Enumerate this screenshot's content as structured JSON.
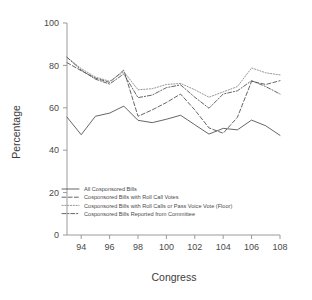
{
  "chart_data": {
    "type": "line",
    "title": "",
    "xlabel": "Congress",
    "ylabel": "Percentage",
    "xlim": [
      93,
      108
    ],
    "ylim": [
      0,
      100
    ],
    "xticks": [
      94,
      96,
      98,
      100,
      102,
      104,
      106,
      108
    ],
    "xtick_labels": [
      "94",
      "96",
      "98",
      "100",
      "102",
      "104",
      "106",
      "108"
    ],
    "yticks": [
      0,
      20,
      40,
      60,
      80,
      100
    ],
    "ytick_labels": [
      "0",
      "20",
      "40",
      "60",
      "80",
      "100"
    ],
    "grid": false,
    "legend_position": "bottom-left",
    "x": [
      93,
      94,
      95,
      96,
      97,
      98,
      99,
      100,
      101,
      102,
      103,
      104,
      105,
      106,
      107,
      108
    ],
    "series": [
      {
        "name": "All Cosponsored Bills",
        "style": "solid",
        "color": "#555555",
        "values": [
          55.6,
          47.3,
          56.0,
          57.5,
          60.8,
          54.1,
          53.0,
          54.6,
          56.5,
          52.0,
          47.6,
          50.3,
          49.6,
          54.2,
          51.5,
          47.0
        ]
      },
      {
        "name": "Cosponsored Bills with Roll Call Votes",
        "style": "dashed",
        "color": "#555555",
        "values": [
          81.3,
          77.5,
          74.0,
          72.0,
          77.8,
          56.0,
          59.0,
          62.5,
          66.5,
          59.0,
          50.5,
          48.0,
          55.5,
          72.5,
          71.0,
          72.8
        ]
      },
      {
        "name": "Cosponsored Bills with Roll Calls or Pass Voice Vote (Floor)",
        "style": "dotted",
        "color": "#8a8a8a",
        "values": [
          83.8,
          78.5,
          74.5,
          72.5,
          77.0,
          68.5,
          69.0,
          71.0,
          71.5,
          68.5,
          65.0,
          67.5,
          70.0,
          78.8,
          76.5,
          75.5
        ]
      },
      {
        "name": "Cosponsored Bills Reported from Committee",
        "style": "dashdot",
        "color": "#555555",
        "values": [
          83.8,
          77.8,
          73.5,
          71.2,
          76.0,
          64.8,
          66.0,
          69.5,
          70.8,
          65.0,
          59.8,
          66.5,
          68.0,
          72.8,
          70.0,
          66.5
        ]
      }
    ]
  },
  "axis": {
    "ylabel": "Percentage",
    "xlabel": "Congress"
  },
  "legend": {
    "items": [
      {
        "label": "All Cosponsored Bills"
      },
      {
        "label": "Cosponsored Bills with Roll Call Votes"
      },
      {
        "label": "Cosponsored Bills with Roll Calls or Pass Voice Vote (Floor)"
      },
      {
        "label": "Cosponsored Bills Reported from Committee"
      }
    ]
  }
}
